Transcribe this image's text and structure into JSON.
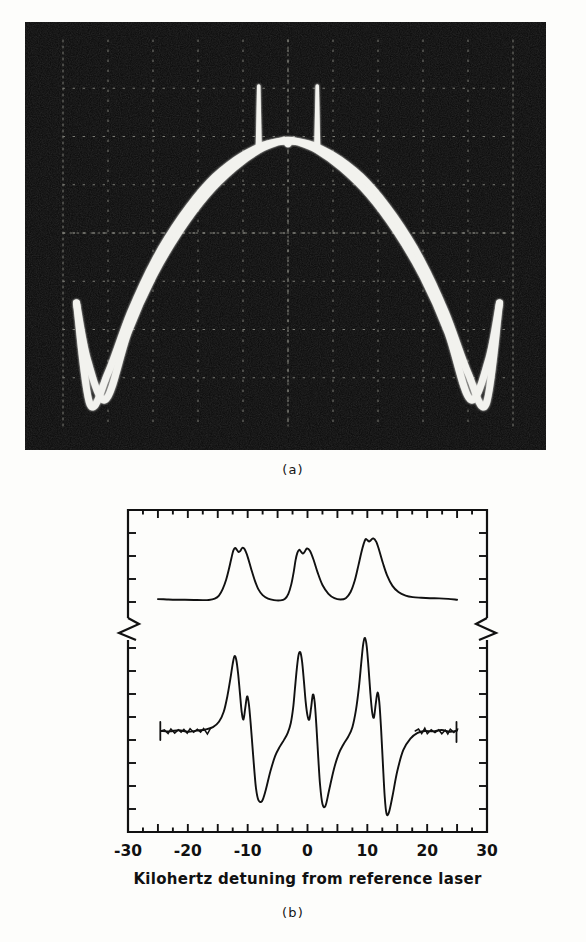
{
  "figure": {
    "panels": [
      {
        "id": "a",
        "caption": "(a)",
        "kind": "oscilloscope-photograph"
      },
      {
        "id": "b",
        "caption": "(b)",
        "kind": "plot"
      }
    ]
  },
  "panel_a": {
    "caption": "(a)",
    "background_color": "#0a0a0a",
    "trace_color": "#f2f2ee",
    "graticule_color": "#8d8d85",
    "graticule_divisions_x": 10,
    "graticule_divisions_y": 8,
    "description": "Oscilloscope trace: broad parabolic envelope with two narrow spikes near the apex and W-shaped turning points at each lower corner."
  },
  "panel_b": {
    "caption": "(b)",
    "frame_color": "#111111",
    "trace_color": "#111111",
    "axis_break": true
  },
  "chart_data": [
    {
      "type": "line",
      "name": "panel-a-oscilloscope",
      "title": "(a)",
      "xlabel": "",
      "ylabel": "",
      "xlim": [
        0,
        10
      ],
      "ylim": [
        0,
        8
      ],
      "grid": "dotted-graticule",
      "legend": "none",
      "series": [
        {
          "name": "envelope-upper-sweep",
          "x": [
            0.3,
            0.55,
            0.95,
            1.45,
            2.0,
            2.6,
            3.2,
            3.8,
            4.35,
            4.75,
            4.95,
            5.0,
            5.05,
            5.25,
            5.65,
            6.2,
            6.8,
            7.4,
            8.0,
            8.55,
            9.05,
            9.45,
            9.7
          ],
          "y": [
            2.55,
            1.35,
            0.55,
            1.95,
            3.1,
            4.05,
            4.8,
            5.35,
            5.72,
            5.88,
            5.9,
            5.85,
            5.9,
            5.88,
            5.72,
            5.35,
            4.8,
            4.05,
            3.1,
            1.95,
            0.55,
            1.35,
            2.55
          ]
        },
        {
          "name": "envelope-lower-sweep",
          "x": [
            0.3,
            0.6,
            1.0,
            1.5,
            2.05,
            2.65,
            3.25,
            3.85,
            4.4,
            4.8,
            5.0,
            5.2,
            5.6,
            6.15,
            6.75,
            7.35,
            7.95,
            8.5,
            9.0,
            9.4,
            9.7
          ],
          "y": [
            2.55,
            0.45,
            1.1,
            2.35,
            3.45,
            4.35,
            5.05,
            5.52,
            5.8,
            5.9,
            5.92,
            5.9,
            5.8,
            5.52,
            5.05,
            4.35,
            3.45,
            2.35,
            1.1,
            0.45,
            2.55
          ]
        },
        {
          "name": "narrow-spike-left",
          "x": [
            4.32,
            4.35,
            4.38
          ],
          "y": [
            5.75,
            7.05,
            5.75
          ]
        },
        {
          "name": "narrow-spike-right",
          "x": [
            5.62,
            5.65,
            5.68
          ],
          "y": [
            5.75,
            7.05,
            5.75
          ]
        }
      ]
    },
    {
      "type": "line",
      "name": "panel-b-spectra",
      "title": "(b)",
      "xlabel": "Kilohertz detuning from reference laser",
      "ylabel": "",
      "xlim": [
        -30,
        30
      ],
      "ylim": [
        0,
        1
      ],
      "xticks": [
        -30,
        -25,
        -20,
        -15,
        -10,
        -5,
        0,
        5,
        10,
        15,
        20,
        25,
        30
      ],
      "xticklabels": [
        "-30",
        "",
        "-20",
        "",
        "-10",
        "",
        "0",
        "",
        "10",
        "",
        "20",
        "",
        "30"
      ],
      "major_xticks": [
        -30,
        -20,
        -10,
        0,
        10,
        20,
        30
      ],
      "grid": false,
      "legend": "none",
      "axis_break_y": true,
      "series": [
        {
          "name": "absorption-upper-trace",
          "comment": "Three doublet resonances centred near -12, -1.5 and +10 kHz; flat wings.",
          "x": [
            -25.0,
            -23.5,
            -22.0,
            -20.5,
            -19.0,
            -17.5,
            -16.5,
            -15.5,
            -14.8,
            -14.2,
            -13.6,
            -13.1,
            -12.7,
            -12.4,
            -12.1,
            -11.8,
            -11.5,
            -11.2,
            -10.9,
            -10.5,
            -10.0,
            -9.4,
            -8.8,
            -8.2,
            -7.5,
            -6.6,
            -5.6,
            -4.6,
            -3.8,
            -3.2,
            -2.7,
            -2.3,
            -2.0,
            -1.7,
            -1.4,
            -1.1,
            -0.8,
            -0.5,
            -0.1,
            0.4,
            1.0,
            1.7,
            2.5,
            3.5,
            4.5,
            5.5,
            6.4,
            7.2,
            7.9,
            8.5,
            9.0,
            9.4,
            9.7,
            10.0,
            10.3,
            10.6,
            11.0,
            11.5,
            12.0,
            12.6,
            13.3,
            14.2,
            15.2,
            16.4,
            17.6,
            19.0,
            20.5,
            22.0,
            23.5,
            25.0
          ],
          "y": [
            0.09,
            0.086,
            0.083,
            0.082,
            0.08,
            0.078,
            0.08,
            0.095,
            0.13,
            0.2,
            0.31,
            0.44,
            0.56,
            0.64,
            0.67,
            0.65,
            0.625,
            0.64,
            0.672,
            0.655,
            0.57,
            0.43,
            0.3,
            0.2,
            0.135,
            0.095,
            0.078,
            0.075,
            0.09,
            0.15,
            0.26,
            0.4,
            0.53,
            0.615,
            0.65,
            0.63,
            0.608,
            0.625,
            0.665,
            0.64,
            0.54,
            0.39,
            0.25,
            0.15,
            0.1,
            0.085,
            0.1,
            0.17,
            0.3,
            0.47,
            0.62,
            0.72,
            0.77,
            0.76,
            0.745,
            0.76,
            0.78,
            0.74,
            0.64,
            0.5,
            0.36,
            0.24,
            0.17,
            0.13,
            0.112,
            0.105,
            0.1,
            0.098,
            0.092,
            0.082
          ]
        },
        {
          "name": "derivative-lower-trace",
          "comment": "Frequency-modulation derivative signal; three dispersive features with sharp recoil doublets.",
          "x": [
            -24.5,
            -23.0,
            -21.5,
            -20.0,
            -18.5,
            -17.0,
            -15.8,
            -14.8,
            -14.0,
            -13.4,
            -12.9,
            -12.5,
            -12.2,
            -11.9,
            -11.6,
            -11.3,
            -11.0,
            -10.7,
            -10.4,
            -10.1,
            -9.8,
            -9.5,
            -9.2,
            -8.9,
            -8.6,
            -8.2,
            -7.6,
            -7.0,
            -6.2,
            -5.4,
            -4.6,
            -3.9,
            -3.3,
            -2.8,
            -2.4,
            -2.1,
            -1.8,
            -1.5,
            -1.2,
            -0.9,
            -0.6,
            -0.3,
            0.0,
            0.3,
            0.6,
            0.9,
            1.2,
            1.5,
            1.8,
            2.1,
            2.5,
            3.0,
            3.6,
            4.4,
            5.2,
            6.0,
            6.8,
            7.5,
            8.1,
            8.6,
            9.0,
            9.3,
            9.6,
            9.9,
            10.2,
            10.5,
            10.8,
            11.1,
            11.4,
            11.7,
            12.0,
            12.3,
            12.6,
            12.9,
            13.2,
            13.6,
            14.2,
            15.0,
            16.0,
            17.2,
            18.4,
            19.6,
            21.0,
            22.4,
            23.8,
            25.0
          ],
          "y": [
            0.5,
            0.498,
            0.504,
            0.496,
            0.502,
            0.508,
            0.52,
            0.548,
            0.6,
            0.68,
            0.77,
            0.85,
            0.89,
            0.87,
            0.8,
            0.7,
            0.6,
            0.56,
            0.62,
            0.68,
            0.64,
            0.54,
            0.42,
            0.3,
            0.2,
            0.14,
            0.135,
            0.19,
            0.29,
            0.37,
            0.42,
            0.455,
            0.49,
            0.54,
            0.62,
            0.72,
            0.82,
            0.895,
            0.91,
            0.86,
            0.76,
            0.65,
            0.58,
            0.56,
            0.62,
            0.69,
            0.65,
            0.52,
            0.36,
            0.22,
            0.12,
            0.11,
            0.19,
            0.3,
            0.38,
            0.43,
            0.47,
            0.52,
            0.61,
            0.73,
            0.86,
            0.95,
            0.985,
            0.94,
            0.83,
            0.7,
            0.6,
            0.57,
            0.64,
            0.7,
            0.65,
            0.51,
            0.33,
            0.16,
            0.07,
            0.075,
            0.16,
            0.29,
            0.4,
            0.46,
            0.49,
            0.5,
            0.498,
            0.505,
            0.496,
            0.502
          ]
        }
      ]
    }
  ],
  "axis": {
    "title": "Kilohertz detuning from reference laser",
    "labels": [
      "-30",
      "-20",
      "-10",
      "0",
      "10",
      "20",
      "30"
    ],
    "values": [
      -30,
      -20,
      -10,
      0,
      10,
      20,
      30
    ]
  }
}
